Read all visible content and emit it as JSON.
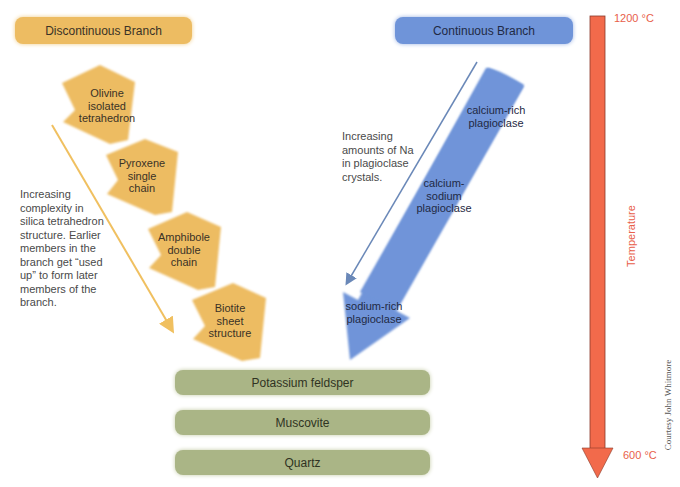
{
  "header": {
    "discontinuous_title": "Discontinuous Branch",
    "continuous_title": "Continuous Branch"
  },
  "discontinuous": {
    "minerals": [
      {
        "line1": "Olivine",
        "line2": "isolated",
        "line3": "tetrahedron"
      },
      {
        "line1": "Pyroxene",
        "line2": "single",
        "line3": "chain"
      },
      {
        "line1": "Amphibole",
        "line2": "double",
        "line3": "chain"
      },
      {
        "line1": "Biotite",
        "line2": "sheet",
        "line3": "structure"
      }
    ],
    "note_lines": [
      "Increasing",
      "complexity in",
      "silica tetrahedron",
      "structure. Earlier",
      "members in the",
      "branch get “used",
      "up” to form later",
      "members of the",
      "branch."
    ],
    "color": "#edbc62"
  },
  "continuous": {
    "stages": [
      {
        "line1": "calcium-rich",
        "line2": "plagioclase"
      },
      {
        "line1": "calcium-",
        "line2": "sodium",
        "line3": "plagioclase"
      },
      {
        "line1": "sodium-rich",
        "line2": "plagioclase"
      }
    ],
    "note_lines": [
      "Increasing",
      "amounts of Na",
      "in plagioclase",
      "crystals."
    ],
    "color": "#6f94d9"
  },
  "final_minerals": [
    "Potassium feldsper",
    "Muscovite",
    "Quartz"
  ],
  "temperature": {
    "top": "1200 °C",
    "bottom": "600 °C",
    "axis_label": "Temperature",
    "color": "#f26a4b"
  },
  "credit": "Courtesy John Whitmore"
}
